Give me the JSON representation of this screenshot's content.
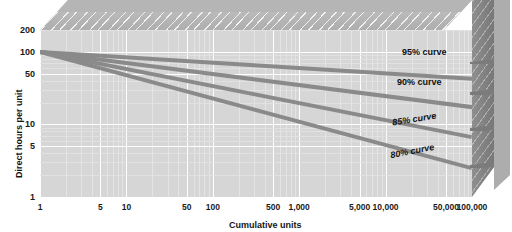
{
  "chart_data": {
    "type": "line",
    "title": "",
    "xlabel": "Cumulative units",
    "ylabel": "Direct hours per unit",
    "xscale": "log",
    "yscale": "log",
    "xlim": [
      1,
      100000
    ],
    "ylim": [
      1,
      200
    ],
    "grid": true,
    "legend_position": "inline-annotations",
    "x_tick_labels": [
      "1",
      "5",
      "10",
      "50",
      "100",
      "500",
      "1,000",
      "5,000",
      "10,000",
      "50,000",
      "100,000"
    ],
    "x_tick_values": [
      1,
      5,
      10,
      50,
      100,
      500,
      1000,
      5000,
      10000,
      50000,
      100000
    ],
    "y_tick_labels": [
      "200",
      "100",
      "50",
      "10",
      "5",
      "1"
    ],
    "y_tick_values": [
      200,
      100,
      50,
      10,
      5,
      1
    ],
    "series": [
      {
        "name": "95% curve",
        "label": "95% curve",
        "learning_rate": 0.95,
        "first_unit_hours": 100,
        "x": [
          1,
          10,
          100,
          1000,
          10000,
          100000
        ],
        "y": [
          100,
          84.4,
          71.2,
          60.1,
          50.7,
          42.8
        ],
        "color": "#8a8a8a"
      },
      {
        "name": "90% curve",
        "label": "90% curve",
        "learning_rate": 0.9,
        "first_unit_hours": 100,
        "x": [
          1,
          10,
          100,
          1000,
          10000,
          100000
        ],
        "y": [
          100,
          70.5,
          49.7,
          35.0,
          24.7,
          17.4
        ],
        "color": "#8a8a8a"
      },
      {
        "name": "85% curve",
        "label": "85% curve",
        "learning_rate": 0.85,
        "first_unit_hours": 100,
        "x": [
          1,
          10,
          100,
          1000,
          10000,
          100000
        ],
        "y": [
          100,
          58.3,
          34.0,
          19.8,
          11.6,
          6.7
        ],
        "color": "#8a8a8a"
      },
      {
        "name": "80% curve",
        "label": "80% curve",
        "learning_rate": 0.8,
        "first_unit_hours": 100,
        "x": [
          1,
          10,
          100,
          1000,
          10000,
          100000
        ],
        "y": [
          100,
          47.7,
          22.8,
          10.9,
          5.2,
          2.5
        ],
        "color": "#8a8a8a"
      }
    ],
    "annotations": [
      {
        "text": "95% curve",
        "series": "95% curve"
      },
      {
        "text": "90% curve",
        "series": "90% curve"
      },
      {
        "text": "85% curve",
        "series": "85% curve"
      },
      {
        "text": "80% curve",
        "series": "80% curve"
      }
    ]
  },
  "axes": {
    "y_title": "Direct hours per unit",
    "x_title": "Cumulative units",
    "y_ticks": [
      {
        "label": "200"
      },
      {
        "label": "100"
      },
      {
        "label": "50"
      },
      {
        "label": "10"
      },
      {
        "label": "5"
      },
      {
        "label": "1"
      }
    ],
    "x_ticks": [
      {
        "label": "1"
      },
      {
        "label": "5"
      },
      {
        "label": "10"
      },
      {
        "label": "50"
      },
      {
        "label": "100"
      },
      {
        "label": "500"
      },
      {
        "label": "1,000"
      },
      {
        "label": "5,000"
      },
      {
        "label": "10,000"
      },
      {
        "label": "50,000"
      },
      {
        "label": "100,000"
      }
    ]
  },
  "curve_labels": [
    {
      "text": "95% curve"
    },
    {
      "text": "90% curve"
    },
    {
      "text": "85% curve"
    },
    {
      "text": "80% curve"
    }
  ],
  "colors": {
    "plot_background": "#d6d6d6",
    "grid_line": "#ffffff",
    "curve": "#8a8a8a",
    "block_top": "#b9b9b9",
    "block_right": "#8d8d8d",
    "text": "#111111"
  }
}
